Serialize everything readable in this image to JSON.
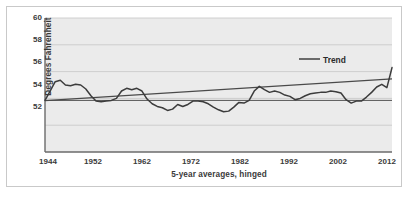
{
  "figure": {
    "frame_color": "#c9c9c9",
    "plot_bg": "#ebebeb",
    "grid_color": "#c5c5c5",
    "series_color": "#3c3c3c",
    "trend_color": "#4a4a4a"
  },
  "chart_data": {
    "type": "line",
    "title": "",
    "subtitle": "",
    "xlabel": "5-year averages, hinged",
    "ylabel": "Degrees Fahrenheit",
    "xlim": [
      1944,
      2012
    ],
    "ylim": [
      50.0,
      60.0
    ],
    "grid": true,
    "legend_position": "inside-top-right",
    "xtick_labels": [
      "1944",
      "1952",
      "1962",
      "1972",
      "1982",
      "1992",
      "2002",
      "2012"
    ],
    "xtick_values": [
      1944,
      1952,
      1962,
      1972,
      1982,
      1992,
      2002,
      2012
    ],
    "ytick_labels": [
      "52",
      "54",
      "56",
      "58",
      "60"
    ],
    "ytick_values": [
      52,
      54,
      56,
      58,
      60
    ],
    "legend": [
      {
        "name": "Trend",
        "label": "Trend",
        "color": "#4a4a4a",
        "marker": "line"
      }
    ],
    "reference_line": {
      "label": "",
      "y": 53.85,
      "color": "#555555"
    },
    "series": [
      {
        "name": "5-year average temperature",
        "label": "",
        "color": "#3c3c3c",
        "x": [
          1944,
          1945,
          1946,
          1947,
          1948,
          1949,
          1950,
          1951,
          1952,
          1953,
          1954,
          1955,
          1956,
          1957,
          1958,
          1959,
          1960,
          1961,
          1962,
          1963,
          1964,
          1965,
          1966,
          1967,
          1968,
          1969,
          1970,
          1971,
          1972,
          1973,
          1974,
          1975,
          1976,
          1977,
          1978,
          1979,
          1980,
          1981,
          1982,
          1983,
          1984,
          1985,
          1986,
          1987,
          1988,
          1989,
          1990,
          1991,
          1992,
          1993,
          1994,
          1995,
          1996,
          1997,
          1998,
          1999,
          2000,
          2001,
          2002,
          2003,
          2004,
          2005,
          2006,
          2007,
          2008,
          2009,
          2010,
          2011,
          2012
        ],
        "y": [
          53.85,
          54.55,
          55.25,
          55.35,
          55.0,
          54.95,
          55.05,
          55.0,
          54.7,
          54.2,
          53.8,
          53.75,
          53.8,
          53.85,
          54.0,
          54.55,
          54.75,
          54.65,
          54.75,
          54.55,
          53.95,
          53.6,
          53.4,
          53.3,
          53.1,
          53.2,
          53.55,
          53.4,
          53.55,
          53.8,
          53.8,
          53.75,
          53.6,
          53.35,
          53.15,
          53.0,
          53.05,
          53.35,
          53.7,
          53.65,
          53.85,
          54.55,
          54.9,
          54.65,
          54.45,
          54.55,
          54.45,
          54.25,
          54.15,
          53.9,
          54.0,
          54.2,
          54.35,
          54.4,
          54.45,
          54.45,
          54.55,
          54.5,
          54.4,
          53.9,
          53.65,
          53.8,
          53.8,
          54.1,
          54.45,
          54.85,
          55.05,
          54.8,
          56.3
        ]
      },
      {
        "name": "Trend",
        "label": "Trend",
        "color": "#4a4a4a",
        "x": [
          1944,
          2012
        ],
        "y": [
          53.83,
          55.45
        ]
      }
    ]
  },
  "caption": {
    "text": ""
  }
}
